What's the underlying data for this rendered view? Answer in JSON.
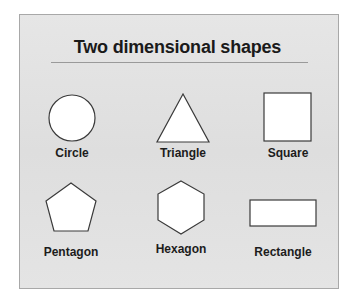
{
  "title": "Two dimensional shapes",
  "shapes": [
    {
      "name": "Circle"
    },
    {
      "name": "Triangle"
    },
    {
      "name": "Square"
    },
    {
      "name": "Pentagon"
    },
    {
      "name": "Hexagon"
    },
    {
      "name": "Rectangle"
    }
  ],
  "colors": {
    "panel": "#e2e2e2",
    "shape_fill": "#ffffff",
    "shape_stroke": "#3a3a3a"
  }
}
